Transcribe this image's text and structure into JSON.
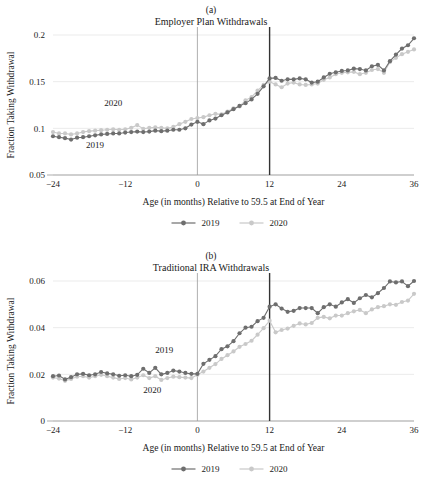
{
  "figure": {
    "colors": {
      "series_2019": "#6e6e6e",
      "series_2020": "#c9c9c9",
      "grid": "#e3e3e3",
      "axis": "#8a8a8a",
      "vline_thin": "#9a9a9a",
      "vline_thick": "#333333"
    }
  },
  "panel_a": {
    "letter": "(a)",
    "title": "Employer Plan Withdrawals",
    "ylabel": "Fraction Taking Withdrawal",
    "xlabel": "Age (in months) Relative to 59.5 at End of Year",
    "yticks": [
      "0.05",
      "0.1",
      "0.15",
      "0.2"
    ],
    "xticks": [
      "-24",
      "-12",
      "0",
      "12",
      "24",
      "36"
    ],
    "annotations": [
      {
        "text": "2020",
        "x": -14,
        "y": 0.1235
      },
      {
        "text": "2019",
        "x": -17,
        "y": 0.0785
      }
    ],
    "legend": [
      {
        "label": "2019"
      },
      {
        "label": "2020"
      }
    ]
  },
  "panel_b": {
    "letter": "(b)",
    "title": "Traditional IRA Withdrawals",
    "ylabel": "Fraction Taking Withdrawal",
    "xlabel": "Age (in months) Relative to 59.5 at End of Year",
    "yticks": [
      "0",
      "0.02",
      "0.04",
      "0.06"
    ],
    "xticks": [
      "-24",
      "-12",
      "0",
      "12",
      "24",
      "36"
    ],
    "annotations": [
      {
        "text": "2019",
        "x": -5.5,
        "y": 0.0292
      },
      {
        "text": "2020",
        "x": -7.5,
        "y": 0.0122
      }
    ],
    "legend": [
      {
        "label": "2019"
      },
      {
        "label": "2020"
      }
    ]
  },
  "chart_data": [
    {
      "type": "line",
      "panel": "(a)",
      "title": "Employer Plan Withdrawals",
      "xlabel": "Age (in months) Relative to 59.5 at End of Year",
      "ylabel": "Fraction Taking Withdrawal",
      "xlim": [
        -24,
        36
      ],
      "ylim": [
        0.05,
        0.2
      ],
      "yticks": [
        0.05,
        0.1,
        0.15,
        0.2
      ],
      "xticks": [
        -24,
        -12,
        0,
        12,
        24,
        36
      ],
      "grid": true,
      "legend_position": "bottom",
      "vlines": [
        0,
        12
      ],
      "x": [
        -24,
        -23,
        -22,
        -21,
        -20,
        -19,
        -18,
        -17,
        -16,
        -15,
        -14,
        -13,
        -12,
        -11,
        -10,
        -9,
        -8,
        -7,
        -6,
        -5,
        -4,
        -3,
        -2,
        -1,
        0,
        1,
        2,
        3,
        4,
        5,
        6,
        7,
        8,
        9,
        10,
        11,
        12,
        13,
        14,
        15,
        16,
        17,
        18,
        19,
        20,
        21,
        22,
        23,
        24,
        25,
        26,
        27,
        28,
        29,
        30,
        31,
        32,
        33,
        34,
        35,
        36
      ],
      "series": [
        {
          "name": "2019",
          "color": "#6e6e6e",
          "values": [
            0.0915,
            0.0905,
            0.0895,
            0.088,
            0.09,
            0.0905,
            0.0915,
            0.0925,
            0.0935,
            0.094,
            0.0945,
            0.0945,
            0.0955,
            0.096,
            0.0965,
            0.096,
            0.0965,
            0.0975,
            0.097,
            0.0975,
            0.0985,
            0.0985,
            0.1,
            0.104,
            0.107,
            0.1045,
            0.1085,
            0.1105,
            0.114,
            0.117,
            0.1205,
            0.124,
            0.127,
            0.131,
            0.137,
            0.145,
            0.1535,
            0.154,
            0.151,
            0.1525,
            0.1525,
            0.1535,
            0.1525,
            0.149,
            0.15,
            0.1545,
            0.1585,
            0.16,
            0.1615,
            0.162,
            0.164,
            0.1635,
            0.162,
            0.1665,
            0.168,
            0.162,
            0.172,
            0.179,
            0.1855,
            0.189,
            0.1965
          ]
        },
        {
          "name": "2020",
          "color": "#c9c9c9",
          "values": [
            0.096,
            0.0945,
            0.0945,
            0.0935,
            0.0945,
            0.096,
            0.097,
            0.0975,
            0.098,
            0.0985,
            0.099,
            0.0985,
            0.099,
            0.1005,
            0.1035,
            0.0995,
            0.1005,
            0.101,
            0.1005,
            0.1,
            0.1015,
            0.1045,
            0.107,
            0.11,
            0.111,
            0.112,
            0.114,
            0.1155,
            0.115,
            0.118,
            0.1215,
            0.1235,
            0.13,
            0.1335,
            0.1405,
            0.1465,
            0.15,
            0.147,
            0.144,
            0.148,
            0.149,
            0.147,
            0.1465,
            0.147,
            0.148,
            0.152,
            0.1545,
            0.158,
            0.1595,
            0.16,
            0.1605,
            0.158,
            0.1595,
            0.1625,
            0.1635,
            0.1595,
            0.171,
            0.1755,
            0.1795,
            0.182,
            0.1845
          ]
        }
      ]
    },
    {
      "type": "line",
      "panel": "(b)",
      "title": "Traditional IRA Withdrawals",
      "xlabel": "Age (in months) Relative to 59.5 at End of Year",
      "ylabel": "Fraction Taking Withdrawal",
      "xlim": [
        -24,
        36
      ],
      "ylim": [
        0,
        0.06
      ],
      "yticks": [
        0,
        0.02,
        0.04,
        0.06
      ],
      "xticks": [
        -24,
        -12,
        0,
        12,
        24,
        36
      ],
      "grid": true,
      "legend_position": "bottom",
      "vlines": [
        0,
        12
      ],
      "x": [
        -24,
        -23,
        -22,
        -21,
        -20,
        -19,
        -18,
        -17,
        -16,
        -15,
        -14,
        -13,
        -12,
        -11,
        -10,
        -9,
        -8,
        -7,
        -6,
        -5,
        -4,
        -3,
        -2,
        -1,
        0,
        1,
        2,
        3,
        4,
        5,
        6,
        7,
        8,
        9,
        10,
        11,
        12,
        13,
        14,
        15,
        16,
        17,
        18,
        19,
        20,
        21,
        22,
        23,
        24,
        25,
        26,
        27,
        28,
        29,
        30,
        31,
        32,
        33,
        34,
        35,
        36
      ],
      "series": [
        {
          "name": "2019",
          "color": "#6e6e6e",
          "values": [
            0.0192,
            0.0195,
            0.0178,
            0.0188,
            0.02,
            0.0202,
            0.0196,
            0.02,
            0.021,
            0.0204,
            0.02,
            0.0194,
            0.0196,
            0.0192,
            0.0198,
            0.0224,
            0.0206,
            0.0228,
            0.02,
            0.0206,
            0.0216,
            0.0212,
            0.0206,
            0.0202,
            0.0202,
            0.0245,
            0.0262,
            0.0278,
            0.0308,
            0.032,
            0.0342,
            0.0376,
            0.04,
            0.0404,
            0.0428,
            0.0442,
            0.049,
            0.05,
            0.0482,
            0.0468,
            0.0472,
            0.0484,
            0.0484,
            0.0484,
            0.0462,
            0.0488,
            0.05,
            0.049,
            0.0508,
            0.0522,
            0.0506,
            0.0526,
            0.054,
            0.053,
            0.0548,
            0.057,
            0.0598,
            0.0594,
            0.0598,
            0.0578,
            0.06
          ]
        },
        {
          "name": "2020",
          "color": "#c9c9c9",
          "values": [
            0.0186,
            0.0182,
            0.0172,
            0.018,
            0.019,
            0.0192,
            0.0186,
            0.0192,
            0.0198,
            0.0192,
            0.0186,
            0.018,
            0.0184,
            0.0178,
            0.0186,
            0.0196,
            0.0184,
            0.0192,
            0.0176,
            0.0184,
            0.019,
            0.0188,
            0.0186,
            0.0184,
            0.0198,
            0.0212,
            0.0228,
            0.0244,
            0.0266,
            0.0282,
            0.0298,
            0.0318,
            0.033,
            0.0344,
            0.037,
            0.0398,
            0.043,
            0.038,
            0.039,
            0.0396,
            0.0408,
            0.0418,
            0.0414,
            0.042,
            0.0442,
            0.0446,
            0.044,
            0.0452,
            0.0452,
            0.0462,
            0.047,
            0.0476,
            0.0462,
            0.0478,
            0.0488,
            0.0492,
            0.05,
            0.0498,
            0.051,
            0.0516,
            0.0545
          ]
        }
      ]
    }
  ]
}
